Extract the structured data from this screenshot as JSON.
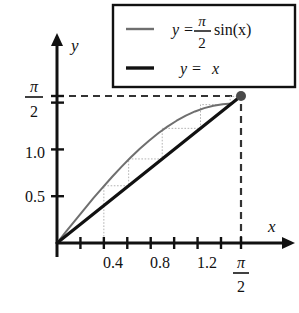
{
  "figure": {
    "name": "cobweb-fixed-point-diagram",
    "background": "#ffffff"
  },
  "legend": {
    "border_color": "#111111",
    "entries": [
      {
        "label": "y = (π/2)sin(x)",
        "lhs": "y",
        "equals": "=",
        "numerator": "π",
        "denominator": "2",
        "func": "sin(x)",
        "color": "#6f6f6f",
        "line_width": 2.0,
        "style": "solid"
      },
      {
        "label": "y = x",
        "lhs": "y",
        "equals": "=",
        "rhs": "x",
        "color": "#111111",
        "line_width": 3.2,
        "style": "solid"
      }
    ]
  },
  "axes": {
    "x_axis_label": "x",
    "y_axis_label": "y",
    "axis_color": "#111111",
    "x_tick_labels": [
      "0.4",
      "0.8",
      "1.2"
    ],
    "x_tick_values": [
      0.4,
      0.8,
      1.2
    ],
    "x_special_tick": {
      "numerator": "π",
      "denominator": "2",
      "value": 1.5708
    },
    "x_minor_ticks": [
      0.2,
      0.4,
      0.6,
      0.8,
      1.0,
      1.2,
      1.4,
      1.5708
    ],
    "y_tick_labels": [
      "0.5",
      "1.0"
    ],
    "y_tick_values": [
      0.5,
      1.0
    ],
    "y_minor_ticks": [
      0.5,
      1.0,
      1.5
    ],
    "y_special_tick": {
      "numerator": "π",
      "denominator": "2",
      "value": 1.5708
    },
    "xlim": [
      0,
      1.78
    ],
    "ylim": [
      0,
      1.78
    ]
  },
  "chart_data": {
    "type": "line",
    "title": "",
    "xlabel": "x",
    "ylabel": "y",
    "xlim": [
      0,
      1.78
    ],
    "ylim": [
      0,
      1.78
    ],
    "grid": false,
    "legend_position": "top-right",
    "series": [
      {
        "name": "y = (π/2)sin(x)",
        "color": "#6f6f6f",
        "line_width": 2.0,
        "x": [
          0,
          0.0785,
          0.1571,
          0.2356,
          0.3142,
          0.3927,
          0.4712,
          0.5498,
          0.6283,
          0.7069,
          0.7854,
          0.8639,
          0.9425,
          1.021,
          1.0996,
          1.1781,
          1.2566,
          1.3352,
          1.4137,
          1.4923,
          1.5708
        ],
        "y": [
          0,
          0.1232,
          0.2454,
          0.3658,
          0.4837,
          0.5981,
          0.7083,
          0.8136,
          0.9133,
          1.0068,
          1.0933,
          1.1725,
          1.2437,
          1.3066,
          1.3606,
          1.4056,
          1.4412,
          1.4672,
          1.4834,
          1.4897,
          1.5708
        ]
      },
      {
        "name": "y = x",
        "color": "#111111",
        "line_width": 3.2,
        "x": [
          0,
          1.5708
        ],
        "y": [
          0,
          1.5708
        ]
      }
    ],
    "cobweb": {
      "name": "fixed-point-iteration-staircase",
      "color": "#b3b3b3",
      "line_width": 1.0,
      "style": "dotted",
      "start_x": 0.4,
      "points": [
        {
          "x": 0.4,
          "y": 0.0
        },
        {
          "x": 0.4,
          "y": 0.6116
        },
        {
          "x": 0.6116,
          "y": 0.6116
        },
        {
          "x": 0.6116,
          "y": 0.8983
        },
        {
          "x": 0.8983,
          "y": 0.8983
        },
        {
          "x": 0.8983,
          "y": 1.2251
        },
        {
          "x": 1.2251,
          "y": 1.2251
        },
        {
          "x": 1.2251,
          "y": 1.4785
        },
        {
          "x": 1.4785,
          "y": 1.4785
        },
        {
          "x": 1.4785,
          "y": 1.5663
        },
        {
          "x": 1.5663,
          "y": 1.5663
        }
      ]
    },
    "fixed_point": {
      "name": "fixed-point-marker",
      "x": 1.5708,
      "y": 1.5708,
      "color": "#4a4a4a",
      "radius": 5
    },
    "guide_lines": [
      {
        "name": "horizontal-dashed-guide",
        "from": [
          0,
          1.5708
        ],
        "to": [
          1.5708,
          1.5708
        ],
        "style": "dashed",
        "color": "#333333"
      },
      {
        "name": "vertical-dashed-guide",
        "from": [
          1.5708,
          0
        ],
        "to": [
          1.5708,
          1.5708
        ],
        "style": "dashed",
        "color": "#333333"
      }
    ]
  }
}
